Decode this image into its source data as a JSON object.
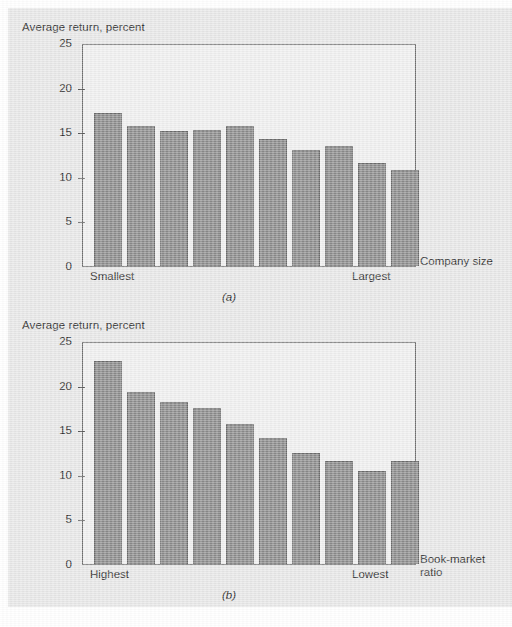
{
  "figure": {
    "background_color": "#e7e7e7",
    "bar_fill_color": "#8a8a8a",
    "bar_border_color": "#6a6a6a",
    "frame_color": "#6d6d6d",
    "plot_background_color": "#efefef"
  },
  "panel_a": {
    "caption": "(a)",
    "y_axis_label": "Average return, percent",
    "x_axis_title": "Company size",
    "x_start_label": "Smallest",
    "x_end_label": "Largest",
    "y_ticks": [
      "25",
      "20",
      "15",
      "10",
      "5",
      "0"
    ]
  },
  "panel_b": {
    "caption": "(b)",
    "y_axis_label": "Average return, percent",
    "x_axis_title_line1": "Book-market",
    "x_axis_title_line2": "ratio",
    "x_start_label": "Highest",
    "x_end_label": "Lowest",
    "y_ticks": [
      "25",
      "20",
      "15",
      "10",
      "5",
      "0"
    ]
  },
  "chart_data": [
    {
      "type": "bar",
      "id": "panel-a",
      "title": "(a)",
      "xlabel": "Company size",
      "ylabel": "Average return, percent",
      "ylim": [
        0,
        25
      ],
      "yticks": [
        0,
        5,
        10,
        15,
        20,
        25
      ],
      "grid": false,
      "legend": null,
      "categories": [
        "1",
        "2",
        "3",
        "4",
        "5",
        "6",
        "7",
        "8",
        "9",
        "10"
      ],
      "category_axis_annotations": {
        "first": "Smallest",
        "last": "Largest"
      },
      "values": [
        17.1,
        15.7,
        15.1,
        15.2,
        15.7,
        14.2,
        13.0,
        13.4,
        11.5,
        10.8
      ]
    },
    {
      "type": "bar",
      "id": "panel-b",
      "title": "(b)",
      "xlabel": "Book-market ratio",
      "ylabel": "Average return, percent",
      "ylim": [
        0,
        25
      ],
      "yticks": [
        0,
        5,
        10,
        15,
        20,
        25
      ],
      "grid": false,
      "legend": null,
      "categories": [
        "1",
        "2",
        "3",
        "4",
        "5",
        "6",
        "7",
        "8",
        "9",
        "10"
      ],
      "category_axis_annotations": {
        "first": "Highest",
        "last": "Lowest"
      },
      "values": [
        22.8,
        19.3,
        18.2,
        17.5,
        15.7,
        14.1,
        12.5,
        11.6,
        10.4,
        11.6
      ]
    }
  ]
}
